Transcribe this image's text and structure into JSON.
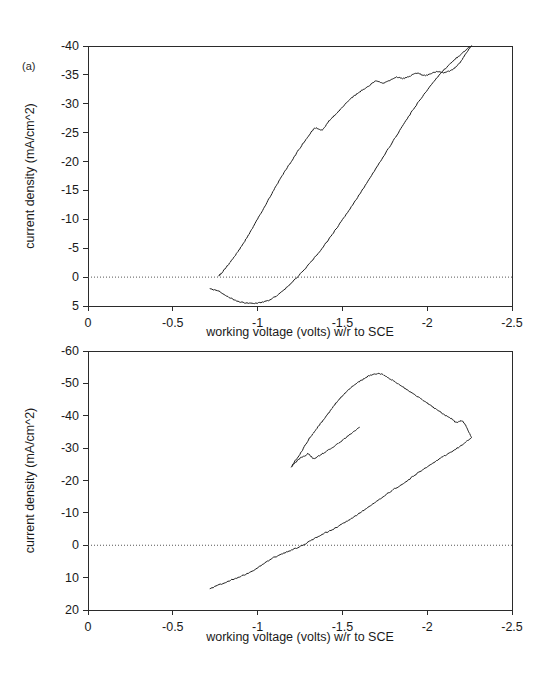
{
  "figure": {
    "panel_a_tag": "(a)",
    "panel_b_tag": "(b)"
  },
  "chart_data": [
    {
      "id": "panel-a",
      "type": "line",
      "title": "",
      "panel_label": "(a)",
      "xlabel": "working voltage (volts) w/r to SCE",
      "ylabel": "current density (mA/cm^2)",
      "xlim": [
        0,
        -2.5
      ],
      "ylim": [
        -40,
        5
      ],
      "y_axis_inverted": true,
      "xticks": [
        0,
        -0.5,
        -1,
        -1.5,
        -2,
        -2.5
      ],
      "xticklabels": [
        "0",
        "-0.5",
        "-1",
        "-1.5",
        "-2",
        "-2.5"
      ],
      "yticks": [
        -40,
        -35,
        -30,
        -25,
        -20,
        -15,
        -10,
        -5,
        0,
        5
      ],
      "yticklabels": [
        "-40",
        "-35",
        "-30",
        "-25",
        "-20",
        "-15",
        "-10",
        "-5",
        "0",
        "5"
      ],
      "grid": false,
      "legend": "none",
      "zero_reference_line": 0,
      "annotations": [],
      "series": [
        {
          "name": "forward sweep",
          "comment": "cathodic scan from -0.72 V toward -2.25 V; small anodic hump then steep cathodic rise",
          "x": [
            -0.72,
            -0.78,
            -0.84,
            -0.9,
            -0.96,
            -1.02,
            -1.08,
            -1.14,
            -1.2,
            -1.26,
            -1.32,
            -1.38,
            -1.44,
            -1.5,
            -1.56,
            -1.62,
            -1.68,
            -1.74,
            -1.8,
            -1.86,
            -1.92,
            -1.98,
            -2.04,
            -2.1,
            -2.16,
            -2.2,
            -2.24,
            -2.26
          ],
          "y": [
            2.0,
            2.6,
            3.6,
            4.3,
            4.5,
            4.4,
            3.8,
            2.6,
            1.0,
            -0.8,
            -2.8,
            -5.0,
            -7.4,
            -9.9,
            -12.5,
            -15.2,
            -18.0,
            -20.8,
            -23.6,
            -26.4,
            -29.1,
            -31.6,
            -33.9,
            -35.9,
            -37.6,
            -38.6,
            -39.6,
            -40.0
          ]
        },
        {
          "name": "reverse sweep",
          "comment": "anodic return scan from -2.26 V back to -0.77 V; plateau near -35 mA/cm^2 between -1.6 and -2.0 V",
          "x": [
            -2.26,
            -2.23,
            -2.2,
            -2.17,
            -2.14,
            -2.1,
            -2.06,
            -2.02,
            -1.98,
            -1.94,
            -1.9,
            -1.86,
            -1.82,
            -1.78,
            -1.74,
            -1.7,
            -1.66,
            -1.62,
            -1.58,
            -1.54,
            -1.5,
            -1.46,
            -1.42,
            -1.38,
            -1.34,
            -1.3,
            -1.26,
            -1.22,
            -1.18,
            -1.14,
            -1.1,
            -1.06,
            -1.02,
            -0.98,
            -0.94,
            -0.9,
            -0.86,
            -0.82,
            -0.79,
            -0.77
          ],
          "y": [
            -40.0,
            -38.8,
            -37.4,
            -36.4,
            -35.8,
            -35.4,
            -35.6,
            -35.2,
            -34.9,
            -35.3,
            -34.8,
            -34.4,
            -34.6,
            -34.1,
            -33.6,
            -33.9,
            -33.2,
            -32.4,
            -31.6,
            -30.6,
            -29.4,
            -28.2,
            -27.0,
            -25.5,
            -25.8,
            -24.4,
            -22.8,
            -21.0,
            -19.2,
            -17.3,
            -15.3,
            -13.2,
            -11.1,
            -9.0,
            -7.0,
            -5.1,
            -3.4,
            -1.9,
            -0.8,
            -0.2
          ]
        }
      ]
    },
    {
      "id": "panel-b",
      "type": "line",
      "title": "",
      "panel_label": "(b)",
      "xlabel": "working voltage (volts) w/r to SCE",
      "ylabel": "current density (mA/cm^2)",
      "xlim": [
        0,
        -2.5
      ],
      "ylim": [
        -60,
        20
      ],
      "y_axis_inverted": true,
      "xticks": [
        0,
        -0.5,
        -1,
        -1.5,
        -2,
        -2.5
      ],
      "xticklabels": [
        "0",
        "-0.5",
        "-1",
        "-1.5",
        "-2",
        "-2.5"
      ],
      "yticks": [
        -60,
        -50,
        -40,
        -30,
        -20,
        -10,
        0,
        10,
        20
      ],
      "yticklabels": [
        "-60",
        "-50",
        "-40",
        "-30",
        "-20",
        "-10",
        "0",
        "10",
        "20"
      ],
      "grid": false,
      "legend": "none",
      "zero_reference_line": 0,
      "annotations": [],
      "series": [
        {
          "name": "forward sweep",
          "comment": "near-linear cathodic scan from -0.72 V at +13 mA/cm^2, crossing zero near -1.08 V, reaching about -33 mA/cm^2 at -2.25 V",
          "x": [
            -0.72,
            -0.78,
            -0.84,
            -0.9,
            -0.96,
            -1.02,
            -1.08,
            -1.14,
            -1.2,
            -1.26,
            -1.32,
            -1.38,
            -1.44,
            -1.5,
            -1.56,
            -1.62,
            -1.68,
            -1.74,
            -1.8,
            -1.86,
            -1.92,
            -1.98,
            -2.04,
            -2.1,
            -2.16,
            -2.22,
            -2.26
          ],
          "y": [
            13.4,
            12.1,
            10.8,
            9.6,
            8.2,
            6.3,
            4.2,
            2.8,
            1.5,
            0.2,
            -1.6,
            -3.4,
            -4.8,
            -6.6,
            -8.5,
            -10.6,
            -12.8,
            -15.0,
            -17.2,
            -19.0,
            -21.4,
            -23.6,
            -25.6,
            -27.6,
            -29.4,
            -31.6,
            -33.2
          ]
        },
        {
          "name": "reverse sweep",
          "comment": "anodic return scan peaking near -53 mA/cm^2 at about -1.72 V, then falling to roughly -38 mA/cm^2 at the -2.26 V turning point",
          "x": [
            -2.26,
            -2.24,
            -2.22,
            -2.2,
            -2.17,
            -2.14,
            -2.1,
            -2.06,
            -2.02,
            -1.98,
            -1.94,
            -1.9,
            -1.86,
            -1.82,
            -1.78,
            -1.74,
            -1.7,
            -1.66,
            -1.62,
            -1.58,
            -1.54,
            -1.5,
            -1.46,
            -1.42,
            -1.38,
            -1.34,
            -1.3,
            -1.26,
            -1.22,
            -1.2
          ],
          "y": [
            -33.4,
            -35.6,
            -37.6,
            -38.4,
            -38.0,
            -39.2,
            -40.4,
            -41.8,
            -43.2,
            -44.6,
            -46.0,
            -47.4,
            -48.8,
            -50.2,
            -51.4,
            -52.6,
            -53.0,
            -52.4,
            -51.2,
            -49.8,
            -48.2,
            -46.2,
            -43.8,
            -41.0,
            -38.2,
            -35.4,
            -32.6,
            -29.0,
            -26.0,
            -24.2
          ]
        },
        {
          "name": "reverse sweep lower branch",
          "comment": "continuation of the return scan from -1.20 V back toward -1.18 V showing the downturn with shoulder near -1.05 V",
          "x": [
            -1.2,
            -1.22,
            -1.24,
            -1.26,
            -1.28,
            -1.3,
            -1.33,
            -1.36,
            -1.4,
            -1.44,
            -1.48,
            -1.52,
            -1.56,
            -1.6
          ],
          "y": [
            -24.2,
            -25.4,
            -26.4,
            -27.2,
            -27.6,
            -28.2,
            -26.8,
            -27.6,
            -28.8,
            -30.2,
            -31.6,
            -33.2,
            -34.8,
            -36.4
          ]
        }
      ]
    }
  ]
}
